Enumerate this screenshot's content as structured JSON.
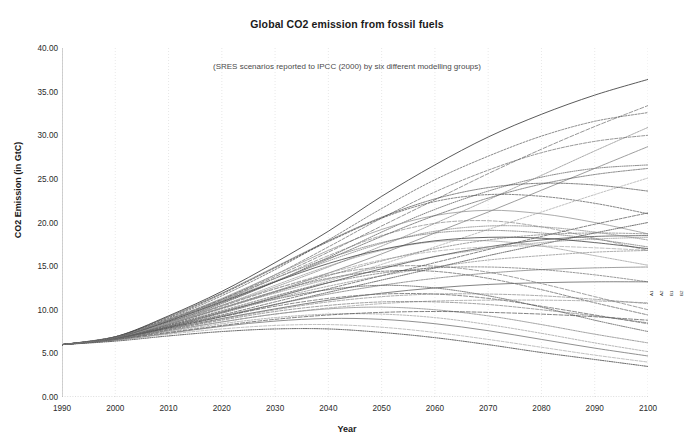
{
  "chart_data": {
    "type": "line",
    "title": "Global CO2 emission from fossil fuels",
    "subtitle": "(SRES scenarios reported to IPCC (2000) by six different modelling groups)",
    "xlabel": "Year",
    "ylabel": "CO2 Emission (in GtC)",
    "xlim": [
      1990,
      2100
    ],
    "ylim": [
      0,
      40
    ],
    "xticks": [
      "1990",
      "2000",
      "2010",
      "2020",
      "2030",
      "2040",
      "2050",
      "2060",
      "2070",
      "2080",
      "2090",
      "2100"
    ],
    "yticks": [
      "0.00",
      "5.00",
      "10.00",
      "15.00",
      "20.00",
      "25.00",
      "30.00",
      "35.00",
      "40.00"
    ],
    "grid": "vertical-dotted-faint",
    "legend": "none",
    "line_color": "#555555",
    "x": [
      1990,
      2000,
      2010,
      2020,
      2030,
      2040,
      2050,
      2060,
      2070,
      2080,
      2090,
      2100
    ],
    "series": [
      {
        "name": "A1FI-1",
        "values": [
          6.0,
          6.9,
          9.3,
          12.1,
          15.4,
          19.0,
          23.0,
          26.6,
          29.8,
          32.4,
          34.6,
          36.4
        ]
      },
      {
        "name": "A1FI-2",
        "values": [
          6.0,
          6.8,
          9.0,
          11.6,
          14.6,
          18.0,
          21.6,
          24.9,
          27.6,
          29.9,
          31.6,
          32.6
        ]
      },
      {
        "name": "A1FI-3",
        "values": [
          6.0,
          6.8,
          8.8,
          11.2,
          14.0,
          17.2,
          20.5,
          23.5,
          26.0,
          28.0,
          29.3,
          30.0
        ]
      },
      {
        "name": "A1FI-4",
        "values": [
          6.0,
          6.7,
          8.5,
          10.7,
          13.2,
          16.0,
          18.9,
          21.5,
          23.6,
          25.2,
          26.2,
          26.6
        ]
      },
      {
        "name": "A1B-1",
        "values": [
          6.0,
          6.8,
          8.7,
          11.0,
          13.6,
          16.2,
          18.5,
          19.9,
          20.2,
          19.5,
          18.2,
          16.8
        ]
      },
      {
        "name": "A1B-2",
        "values": [
          6.0,
          6.7,
          8.4,
          10.5,
          12.8,
          15.0,
          16.8,
          17.8,
          17.9,
          17.3,
          16.2,
          15.1
        ]
      },
      {
        "name": "A1B-3",
        "values": [
          6.0,
          6.8,
          8.9,
          11.3,
          14.0,
          16.8,
          19.2,
          20.8,
          21.4,
          21.0,
          20.0,
          18.7
        ]
      },
      {
        "name": "A1B-4",
        "values": [
          6.0,
          6.9,
          9.1,
          11.8,
          14.8,
          17.8,
          20.5,
          22.4,
          23.2,
          23.0,
          22.2,
          21.0
        ]
      },
      {
        "name": "A1T-1",
        "values": [
          6.0,
          6.7,
          8.3,
          10.2,
          12.1,
          13.6,
          14.4,
          14.4,
          13.6,
          12.3,
          10.8,
          9.4
        ]
      },
      {
        "name": "A1T-2",
        "values": [
          6.0,
          6.6,
          8.0,
          9.6,
          11.2,
          12.3,
          12.8,
          12.5,
          11.6,
          10.3,
          8.8,
          7.5
        ]
      },
      {
        "name": "A1T-3",
        "values": [
          6.0,
          6.7,
          8.4,
          10.4,
          12.4,
          14.0,
          14.9,
          15.0,
          14.3,
          13.0,
          11.5,
          10.0
        ]
      },
      {
        "name": "A2-1",
        "values": [
          6.0,
          6.9,
          8.6,
          10.5,
          12.6,
          14.9,
          17.3,
          19.9,
          22.6,
          25.4,
          28.2,
          30.9
        ]
      },
      {
        "name": "A2-2",
        "values": [
          6.0,
          6.8,
          8.4,
          10.2,
          12.1,
          14.2,
          16.4,
          18.8,
          21.2,
          23.7,
          26.2,
          28.7
        ]
      },
      {
        "name": "A2-3",
        "values": [
          6.0,
          6.8,
          8.2,
          9.8,
          11.5,
          13.3,
          15.2,
          17.2,
          19.2,
          21.2,
          23.2,
          25.1
        ]
      },
      {
        "name": "A2-4",
        "values": [
          6.0,
          6.7,
          8.0,
          9.4,
          10.9,
          12.4,
          13.9,
          15.4,
          16.9,
          18.4,
          19.8,
          21.1
        ]
      },
      {
        "name": "A2-5",
        "values": [
          6.0,
          6.7,
          7.9,
          9.2,
          10.6,
          12.0,
          13.4,
          14.8,
          16.2,
          17.5,
          18.8,
          20.0
        ]
      },
      {
        "name": "A2-6",
        "values": [
          6.0,
          6.9,
          8.9,
          11.2,
          13.8,
          16.6,
          19.6,
          22.6,
          25.6,
          28.4,
          31.0,
          33.4
        ]
      },
      {
        "name": "B1-1",
        "values": [
          6.0,
          6.6,
          7.6,
          8.6,
          9.5,
          10.1,
          10.3,
          10.0,
          9.3,
          8.3,
          7.2,
          6.2
        ]
      },
      {
        "name": "B1-2",
        "values": [
          6.0,
          6.5,
          7.3,
          8.1,
          8.7,
          9.0,
          8.9,
          8.4,
          7.6,
          6.6,
          5.6,
          4.7
        ]
      },
      {
        "name": "B1-3",
        "values": [
          6.0,
          6.6,
          7.5,
          8.4,
          9.1,
          9.5,
          9.5,
          9.1,
          8.3,
          7.3,
          6.2,
          5.2
        ]
      },
      {
        "name": "B1-4",
        "values": [
          6.0,
          6.5,
          7.2,
          7.8,
          8.2,
          8.3,
          8.0,
          7.4,
          6.6,
          5.7,
          4.8,
          4.0
        ]
      },
      {
        "name": "B1-5",
        "values": [
          6.0,
          6.4,
          7.0,
          7.5,
          7.8,
          7.8,
          7.4,
          6.8,
          6.0,
          5.1,
          4.3,
          3.5
        ]
      },
      {
        "name": "B1-6",
        "values": [
          6.0,
          6.7,
          7.9,
          9.2,
          10.4,
          11.3,
          11.8,
          11.8,
          11.3,
          10.4,
          9.4,
          8.4
        ]
      },
      {
        "name": "B2-1",
        "values": [
          6.0,
          6.7,
          8.0,
          9.3,
          10.6,
          11.8,
          12.8,
          13.6,
          14.2,
          14.6,
          14.8,
          14.9
        ]
      },
      {
        "name": "B2-2",
        "values": [
          6.0,
          6.7,
          7.8,
          9.0,
          10.1,
          11.1,
          11.9,
          12.5,
          12.9,
          13.1,
          13.2,
          13.2
        ]
      },
      {
        "name": "B2-3",
        "values": [
          6.0,
          6.8,
          8.2,
          9.8,
          11.3,
          12.7,
          13.9,
          14.9,
          15.7,
          16.2,
          16.6,
          16.8
        ]
      },
      {
        "name": "B2-4",
        "values": [
          6.0,
          6.6,
          7.6,
          8.6,
          9.5,
          10.2,
          10.7,
          11.0,
          11.1,
          11.1,
          11.0,
          10.8
        ]
      },
      {
        "name": "B2-5",
        "values": [
          6.0,
          6.8,
          8.4,
          10.2,
          11.9,
          13.5,
          14.9,
          16.1,
          17.0,
          17.7,
          18.1,
          18.3
        ]
      },
      {
        "name": "B2-6",
        "values": [
          6.0,
          6.6,
          7.4,
          8.2,
          8.9,
          9.4,
          9.7,
          9.8,
          9.7,
          9.5,
          9.2,
          8.8
        ]
      },
      {
        "name": "IS92-1",
        "values": [
          6.0,
          6.8,
          8.6,
          10.8,
          13.2,
          15.8,
          18.4,
          20.8,
          22.8,
          24.4,
          25.5,
          26.2
        ]
      },
      {
        "name": "IS92-2",
        "values": [
          6.0,
          6.7,
          8.1,
          9.7,
          11.4,
          13.1,
          14.7,
          16.1,
          17.2,
          18.0,
          18.4,
          18.5
        ]
      },
      {
        "name": "IS92-3",
        "values": [
          6.0,
          6.7,
          8.3,
          10.1,
          12.0,
          13.9,
          15.6,
          17.0,
          18.0,
          18.6,
          18.8,
          18.7
        ]
      },
      {
        "name": "IS92-4",
        "values": [
          6.0,
          6.6,
          7.7,
          8.9,
          10.0,
          10.9,
          11.5,
          11.8,
          11.8,
          11.6,
          11.2,
          10.7
        ]
      },
      {
        "name": "IS92-5",
        "values": [
          6.0,
          6.9,
          8.8,
          11.0,
          13.3,
          15.6,
          17.6,
          19.0,
          19.6,
          19.5,
          18.9,
          18.0
        ]
      },
      {
        "name": "IS92-6",
        "values": [
          6.0,
          6.8,
          8.5,
          10.4,
          12.4,
          14.2,
          15.7,
          16.7,
          17.2,
          17.3,
          17.1,
          16.8
        ]
      },
      {
        "name": "MIX-1",
        "values": [
          6.0,
          6.9,
          9.2,
          11.9,
          14.9,
          17.9,
          20.6,
          22.7,
          24.0,
          24.5,
          24.3,
          23.6
        ]
      },
      {
        "name": "MIX-2",
        "values": [
          6.0,
          6.8,
          8.7,
          10.9,
          13.2,
          15.3,
          16.9,
          17.9,
          18.3,
          18.2,
          17.7,
          17.0
        ]
      },
      {
        "name": "MIX-3",
        "values": [
          6.0,
          6.7,
          8.2,
          9.9,
          11.6,
          13.1,
          14.2,
          14.8,
          14.9,
          14.6,
          14.0,
          13.2
        ]
      },
      {
        "name": "MIX-4",
        "values": [
          6.0,
          6.6,
          7.7,
          8.8,
          9.8,
          10.5,
          10.9,
          10.9,
          10.6,
          10.0,
          9.3,
          8.5
        ]
      },
      {
        "name": "MIX-5",
        "values": [
          6.0,
          6.8,
          8.8,
          11.1,
          13.6,
          15.9,
          17.7,
          18.8,
          19.1,
          18.8,
          18.1,
          17.2
        ]
      }
    ],
    "range_bars": [
      {
        "x": 2100,
        "low": 3.4,
        "high": 37.5,
        "label": "A1"
      },
      {
        "x": 2100,
        "low": 8.5,
        "high": 29.5,
        "label": "A2"
      },
      {
        "x": 2100,
        "low": 4.0,
        "high": 23.0,
        "label": "B1"
      },
      {
        "x": 2100,
        "low": 6.0,
        "high": 27.0,
        "label": "B2"
      }
    ]
  }
}
